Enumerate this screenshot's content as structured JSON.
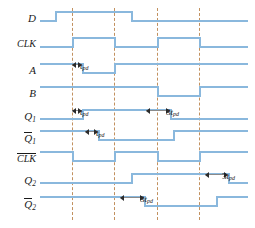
{
  "figure": {
    "type": "digital-timing-diagram",
    "colors": {
      "waveform": "#8ab8dd",
      "gridline": "#c2915f",
      "marker": "#8a8a8a",
      "text": "#1a1a1a",
      "background": "#ffffff"
    }
  },
  "signals": [
    {
      "name": "D",
      "label": "D",
      "overbar": false,
      "subscript": "",
      "y": 20
    },
    {
      "name": "CLK",
      "label": "CLK",
      "overbar": false,
      "subscript": "",
      "y": 46
    },
    {
      "name": "A",
      "label": "A",
      "overbar": false,
      "subscript": "",
      "y": 72
    },
    {
      "name": "B",
      "label": "B",
      "overbar": false,
      "subscript": "",
      "y": 95
    },
    {
      "name": "Q1",
      "label": "Q",
      "overbar": false,
      "subscript": "1",
      "y": 118
    },
    {
      "name": "Q1bar",
      "label": "Q",
      "overbar": true,
      "subscript": "1",
      "y": 139
    },
    {
      "name": "CLKbar",
      "label": "CLK",
      "overbar": true,
      "subscript": "",
      "y": 160
    },
    {
      "name": "Q2",
      "label": "Q",
      "overbar": false,
      "subscript": "2",
      "y": 182
    },
    {
      "name": "Q2bar",
      "label": "Q",
      "overbar": true,
      "subscript": "2",
      "y": 205
    }
  ],
  "gridlines": [
    72,
    114,
    157,
    199
  ],
  "delay_labels": [
    {
      "id": "tpd-A",
      "text": "t",
      "sub": "pd",
      "prefix": "",
      "x": 80,
      "y": 62
    },
    {
      "id": "tpd-Q1",
      "text": "t",
      "sub": "pd",
      "prefix": "",
      "x": 80,
      "y": 108
    },
    {
      "id": "tpd-Q1bar",
      "text": "t",
      "sub": "pd",
      "prefix": "",
      "x": 96,
      "y": 129
    },
    {
      "id": "3tpd-Q1",
      "text": "t",
      "sub": "pd",
      "prefix": "3",
      "x": 166,
      "y": 108
    },
    {
      "id": "3tpd-Q2",
      "text": "t",
      "sub": "pd",
      "prefix": "3",
      "x": 222,
      "y": 172
    },
    {
      "id": "3tpd-Q2bar",
      "text": "t",
      "sub": "pd",
      "prefix": "3",
      "x": 140,
      "y": 195
    }
  ],
  "chart_data": {
    "type": "line",
    "xlabel": "time",
    "ylabel": "logic level",
    "grid": true,
    "xlim": [
      40,
      248
    ],
    "gridlines_x": [
      72,
      114,
      157,
      199
    ],
    "series": [
      {
        "name": "D",
        "initial": 0,
        "transitions": [
          {
            "x": 55,
            "to": 1
          },
          {
            "x": 131,
            "to": 0
          }
        ]
      },
      {
        "name": "CLK",
        "initial": 0,
        "transitions": [
          {
            "x": 72,
            "to": 1
          },
          {
            "x": 114,
            "to": 0
          },
          {
            "x": 157,
            "to": 1
          },
          {
            "x": 199,
            "to": 0
          }
        ]
      },
      {
        "name": "A",
        "initial": 1,
        "transitions": [
          {
            "x": 82,
            "to": 0
          },
          {
            "x": 114,
            "to": 1
          }
        ]
      },
      {
        "name": "B",
        "initial": 1,
        "transitions": [
          {
            "x": 157,
            "to": 0
          },
          {
            "x": 199,
            "to": 1
          }
        ]
      },
      {
        "name": "Q1",
        "initial": 0,
        "transitions": [
          {
            "x": 82,
            "to": 1
          },
          {
            "x": 170,
            "to": 0
          }
        ]
      },
      {
        "name": "Q1bar",
        "initial": 1,
        "transitions": [
          {
            "x": 98,
            "to": 0
          },
          {
            "x": 173,
            "to": 1
          }
        ]
      },
      {
        "name": "CLKbar",
        "initial": 1,
        "transitions": [
          {
            "x": 72,
            "to": 0
          },
          {
            "x": 114,
            "to": 1
          },
          {
            "x": 157,
            "to": 0
          },
          {
            "x": 199,
            "to": 1
          }
        ]
      },
      {
        "name": "Q2",
        "initial": 0,
        "transitions": [
          {
            "x": 131,
            "to": 1
          },
          {
            "x": 228,
            "to": 0
          }
        ]
      },
      {
        "name": "Q2bar",
        "initial": 1,
        "transitions": [
          {
            "x": 144,
            "to": 0
          },
          {
            "x": 216,
            "to": 1
          }
        ]
      }
    ],
    "annotations": [
      {
        "label": "t_pd",
        "signal": "A",
        "from_x": 72,
        "to_x": 82
      },
      {
        "label": "t_pd",
        "signal": "Q1",
        "from_x": 72,
        "to_x": 82
      },
      {
        "label": "t_pd",
        "signal": "Q1bar",
        "from_x": 85,
        "to_x": 98
      },
      {
        "label": "3t_pd",
        "signal": "Q1",
        "from_x": 146,
        "to_x": 170
      },
      {
        "label": "3t_pd",
        "signal": "Q2",
        "from_x": 205,
        "to_x": 228
      },
      {
        "label": "3t_pd",
        "signal": "Q2bar",
        "from_x": 120,
        "to_x": 144
      }
    ]
  }
}
